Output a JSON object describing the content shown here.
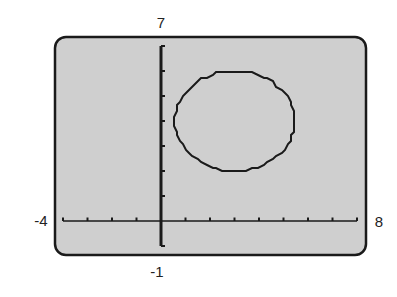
{
  "chart_data": {
    "type": "line",
    "title": "",
    "xlabel": "",
    "ylabel": "",
    "xlim": [
      -4,
      8
    ],
    "ylim": [
      -1,
      7
    ],
    "xscale": 1,
    "yscale": 1,
    "grid": false,
    "window_labels": {
      "xmin": "-4",
      "xmax": "8",
      "ymin": "-1",
      "ymax": "7"
    },
    "series": [
      {
        "name": "circle",
        "shape": "circle",
        "center": [
          3,
          4
        ],
        "radius": 2,
        "equation": "(x-3)^2 + (y-4)^2 = 4"
      }
    ]
  },
  "colors": {
    "screen_fill": "#cfcfcf",
    "ink": "#1a1a1a",
    "background": "#ffffff"
  }
}
